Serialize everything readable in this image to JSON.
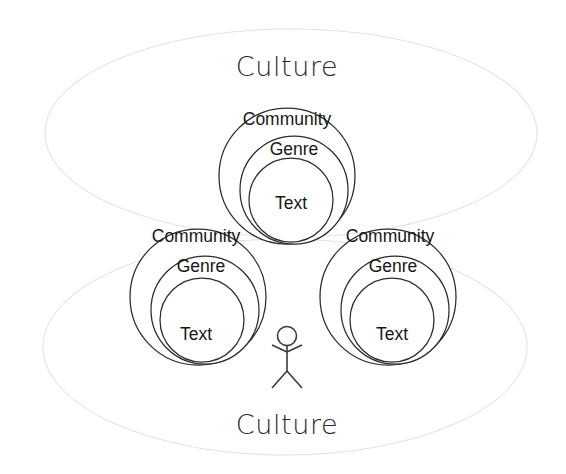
{
  "diagram": {
    "background_color": "#ffffff",
    "stroke_color": "#2b2b2b",
    "ellipse_stroke_color": "#e3e3e3",
    "culture_top": {
      "label": "Culture",
      "x": 287,
      "y": 66
    },
    "culture_bottom": {
      "label": "Culture",
      "x": 287,
      "y": 424
    },
    "ellipses": [
      {
        "name": "culture-ellipse-top",
        "cx": 291,
        "cy": 133,
        "rx": 246,
        "ry": 104
      },
      {
        "name": "culture-ellipse-bottom",
        "cx": 285,
        "cy": 347,
        "rx": 242,
        "ry": 108
      }
    ],
    "clusters": [
      {
        "name": "cluster-top",
        "community": {
          "label": "Community",
          "cx": 287,
          "cy": 176,
          "r": 68,
          "label_x": 287,
          "label_y": 119
        },
        "genre": {
          "label": "Genre",
          "cx": 294,
          "cy": 190,
          "r": 54,
          "label_x": 294,
          "label_y": 149
        },
        "text": {
          "label": "Text",
          "cx": 291,
          "cy": 200,
          "r": 42,
          "label_x": 291,
          "label_y": 203
        }
      },
      {
        "name": "cluster-bottom-left",
        "community": {
          "label": "Community",
          "cx": 198,
          "cy": 297,
          "r": 68,
          "label_x": 196,
          "label_y": 236
        },
        "genre": {
          "label": "Genre",
          "cx": 205,
          "cy": 310,
          "r": 54,
          "label_x": 201,
          "label_y": 266
        },
        "text": {
          "label": "Text",
          "cx": 202,
          "cy": 320,
          "r": 42,
          "label_x": 196,
          "label_y": 334
        }
      },
      {
        "name": "cluster-bottom-right",
        "community": {
          "label": "Community",
          "cx": 388,
          "cy": 297,
          "r": 68,
          "label_x": 390,
          "label_y": 236
        },
        "genre": {
          "label": "Genre",
          "cx": 395,
          "cy": 310,
          "r": 54,
          "label_x": 393,
          "label_y": 266
        },
        "text": {
          "label": "Text",
          "cx": 392,
          "cy": 320,
          "r": 42,
          "label_x": 392,
          "label_y": 334
        }
      }
    ],
    "stick_figure": {
      "name": "person",
      "head_cx": 287,
      "head_cy": 336,
      "head_r": 9.5,
      "body_top_y": 345,
      "body_bottom_y": 371,
      "arm_left_x": 272,
      "arm_right_x": 302,
      "arm_y": 352,
      "leg_left_x": 272,
      "leg_right_x": 302,
      "leg_y": 388
    }
  }
}
